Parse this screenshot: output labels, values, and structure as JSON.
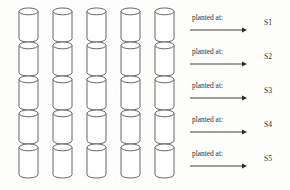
{
  "figure": {
    "type": "diagram",
    "background_color": "#fdfdfc",
    "outline_color": "#555555",
    "text_color": "#2f2f2f",
    "grid": {
      "columns": 5,
      "rows": 5,
      "cell_shape": "cylinder",
      "first_column_x": 19,
      "column_spacing": 34,
      "cylinder_width": 19,
      "cylinder_height": 34,
      "ellipse_ry": 3.4,
      "first_row_y": 8,
      "row_spacing": 34
    },
    "rows": [
      {
        "label": "planted at:",
        "site": "S1"
      },
      {
        "label": "planted at:",
        "site": "S2"
      },
      {
        "label": "planted at:",
        "site": "S3"
      },
      {
        "label": "planted at:",
        "site": "S4"
      },
      {
        "label": "planted at:",
        "site": "S5"
      }
    ],
    "arrow": {
      "x_start": 190,
      "x_end": 247,
      "head_length": 5,
      "head_half_width": 2.4,
      "color": "#2a2a2a"
    },
    "label_x": 192,
    "site_label_x": 264,
    "row_label_offsets": {
      "text_y": 20,
      "arrow_y": 30
    }
  }
}
